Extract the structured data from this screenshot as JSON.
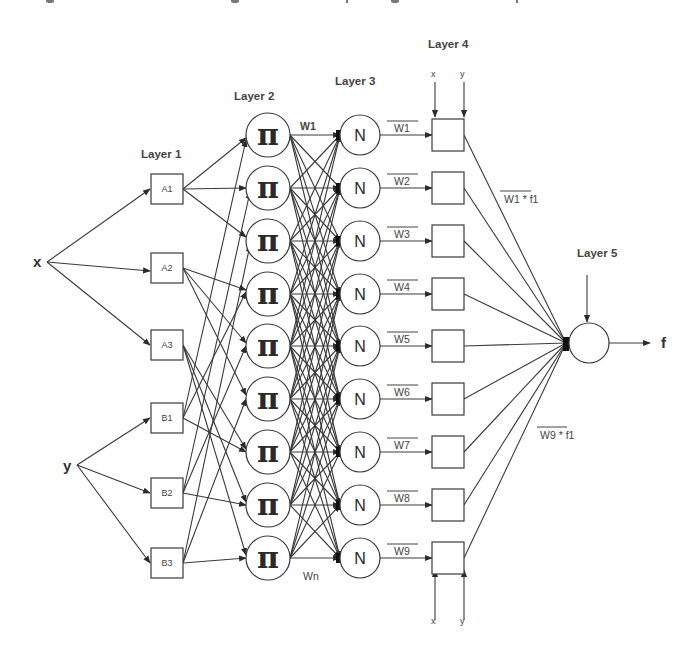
{
  "diagram": {
    "type": "ANFIS neural-fuzzy network architecture",
    "inputs": {
      "x": "x",
      "y": "y"
    },
    "output": {
      "label": "f"
    },
    "layers": {
      "layer1": {
        "label": "Layer 1",
        "nodes": [
          "A1",
          "A2",
          "A3",
          "B1",
          "B2",
          "B3"
        ]
      },
      "layer2": {
        "label": "Layer 2",
        "node_symbol": "π",
        "count": 9,
        "first_weight": "W1",
        "last_weight": "Wn"
      },
      "layer3": {
        "label": "Layer 3",
        "node_symbol": "N",
        "count": 9,
        "normalized_weights": [
          "W1",
          "W2",
          "W3",
          "W4",
          "W5",
          "W6",
          "W7",
          "W8",
          "W9"
        ]
      },
      "layer4": {
        "label": "Layer 4",
        "count": 9,
        "top_inputs": [
          "x",
          "y"
        ],
        "bottom_inputs": [
          "x",
          "y"
        ],
        "annotation_top": "W1 * f1",
        "annotation_bottom": "W9 * f1"
      },
      "layer5": {
        "label": "Layer 5"
      }
    },
    "colors": {
      "line": "#3a3a3a",
      "background": "#ffffff",
      "text": "#333333"
    }
  }
}
